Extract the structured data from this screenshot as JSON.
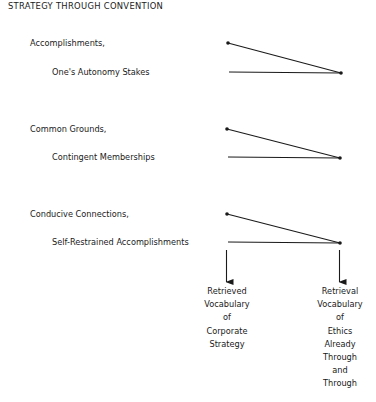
{
  "title": "STRATEGY THROUGH CONVENTION",
  "groups": [
    {
      "upper_label": "Accomplishments,",
      "lower_label": "One's Autonomy Stakes"
    },
    {
      "upper_label": "Common Grounds,",
      "lower_label": "Contingent Memberships"
    },
    {
      "upper_label": "Conducive Connections,",
      "lower_label": "Self-Restrained Accomplishments"
    }
  ],
  "outputs": {
    "left": [
      "Retrieved",
      "Vocabulary",
      "of",
      "Corporate",
      "Strategy"
    ],
    "right": [
      "Retrieval",
      "Vocabulary",
      "of",
      "Ethics",
      "Already",
      "Through",
      "and",
      "Through"
    ]
  },
  "colors": {
    "ink": "#1a1a1a",
    "background": "#ffffff"
  }
}
